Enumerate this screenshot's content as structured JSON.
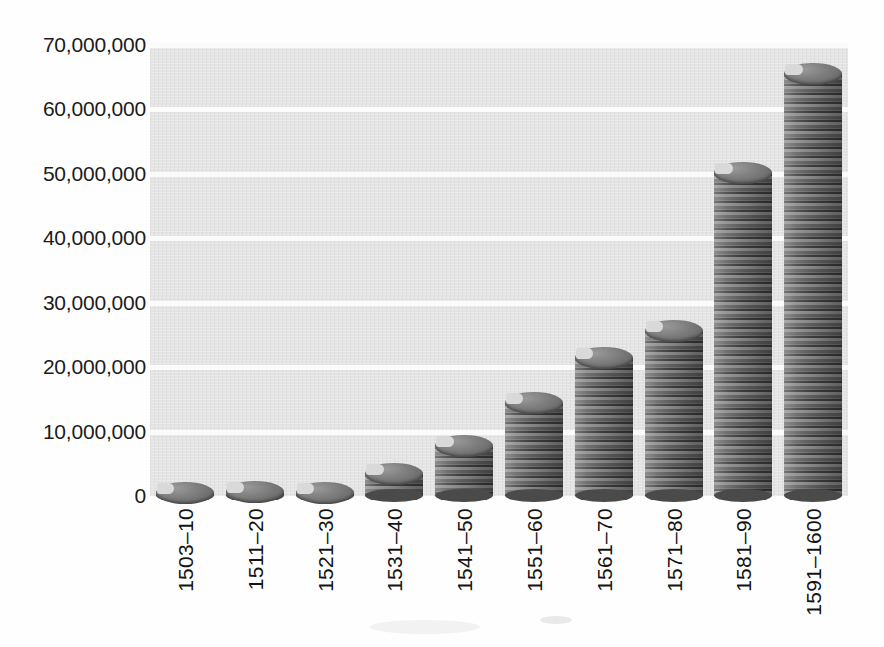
{
  "chart_data": {
    "type": "bar",
    "title": "",
    "subtitle": "",
    "xlabel": "",
    "ylabel": "",
    "categories": [
      "1503–10",
      "1511–20",
      "1521–30",
      "1531–40",
      "1541–50",
      "1551–60",
      "1561–70",
      "1571–80",
      "1581–90",
      "1591–1600"
    ],
    "values": [
      1800000,
      2000000,
      1700000,
      4800000,
      9200000,
      15800000,
      22800000,
      27000000,
      51500000,
      66900000
    ],
    "ylim": [
      0,
      70000000
    ],
    "ytick_values": [
      0,
      10000000,
      20000000,
      30000000,
      40000000,
      50000000,
      60000000,
      70000000
    ],
    "ytick_labels": [
      "0",
      "10,000,000",
      "20,000,000",
      "30,000,000",
      "40,000,000",
      "50,000,000",
      "60,000,000",
      "70,000,000"
    ],
    "grid": true,
    "grid_axis": "y",
    "grid_color": "#fbfbfb",
    "legend": null,
    "series": [
      {
        "name": "",
        "values": [
          1800000,
          2000000,
          1700000,
          4800000,
          9200000,
          15800000,
          22800000,
          27000000,
          51500000,
          66900000
        ]
      }
    ],
    "bar_style": "coin-stack-cylinder",
    "plot_background": "#e4e4e4",
    "bar_color": "#5d5d5d",
    "text_color": "#141414"
  },
  "axes": {
    "y": {
      "ticks": [
        {
          "label": "70,000,000",
          "value": 70000000
        },
        {
          "label": "60,000,000",
          "value": 60000000
        },
        {
          "label": "50,000,000",
          "value": 50000000
        },
        {
          "label": "40,000,000",
          "value": 40000000
        },
        {
          "label": "30,000,000",
          "value": 30000000
        },
        {
          "label": "20,000,000",
          "value": 20000000
        },
        {
          "label": "10,000,000",
          "value": 10000000
        },
        {
          "label": "0",
          "value": 0
        }
      ]
    },
    "x": {
      "ticks": [
        {
          "label": "1503–10"
        },
        {
          "label": "1511–20"
        },
        {
          "label": "1521–30"
        },
        {
          "label": "1531–40"
        },
        {
          "label": "1541–50"
        },
        {
          "label": "1551–60"
        },
        {
          "label": "1561–70"
        },
        {
          "label": "1571–80"
        },
        {
          "label": "1581–90"
        },
        {
          "label": "1591–1600"
        }
      ]
    }
  }
}
